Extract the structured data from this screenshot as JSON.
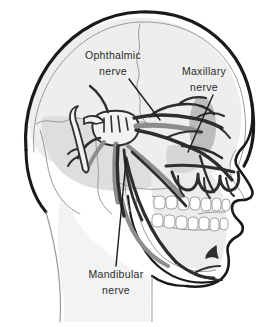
{
  "figure": {
    "type": "anatomical-line-illustration",
    "background_color": "#ffffff",
    "width": 278,
    "height": 327
  },
  "palette": {
    "outline_black": "#1a1a1a",
    "nerve_dark": "#2e2e2e",
    "nerve_mid_gray": "#8d8d8d",
    "bone_line_gray": "#9a9a9a",
    "shade_light": "#e9e9e9",
    "shade_medium": "#cfcfcf",
    "shade_dark": "#b0b0b0",
    "label_color": "#2b2b2b",
    "leader_line_color": "#1a1a1a"
  },
  "labels": [
    {
      "id": "ophthalmic",
      "line1": "Ophthalmic",
      "line2": "nerve",
      "x": 113,
      "y1": 56,
      "y2": 72,
      "leader": {
        "x1": 129,
        "y1": 79,
        "x2": 160,
        "y2": 120
      }
    },
    {
      "id": "maxillary",
      "line1": "Maxillary",
      "line2": "nerve",
      "x": 204,
      "y1": 72,
      "y2": 88,
      "leader": {
        "x1": 213,
        "y1": 95,
        "x2": 188,
        "y2": 152
      }
    },
    {
      "id": "mandibular",
      "line1": "Mandibular",
      "line2": "nerve",
      "x": 116,
      "y1": 275,
      "y2": 291,
      "leader": {
        "x1": 116,
        "y1": 266,
        "x2": 126,
        "y2": 160
      }
    }
  ]
}
